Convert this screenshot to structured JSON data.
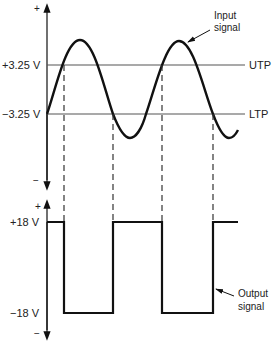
{
  "diagram": {
    "type": "schmitt-trigger-waveforms",
    "input_graph": {
      "axis_plus": "+",
      "axis_minus": "−",
      "utp_value": "+3.25 V",
      "ltp_value": "−3.25 V",
      "utp_label": "UTP",
      "ltp_label": "LTP",
      "signal_label_line1": "Input",
      "signal_label_line2": "signal"
    },
    "output_graph": {
      "axis_plus": "+",
      "axis_minus": "−",
      "high_value": "+18 V",
      "low_value": "−18 V",
      "signal_label_line1": "Output",
      "signal_label_line2": "signal"
    },
    "colors": {
      "stroke": "#111111",
      "threshold_line": "#555555",
      "text": "#222222"
    }
  }
}
